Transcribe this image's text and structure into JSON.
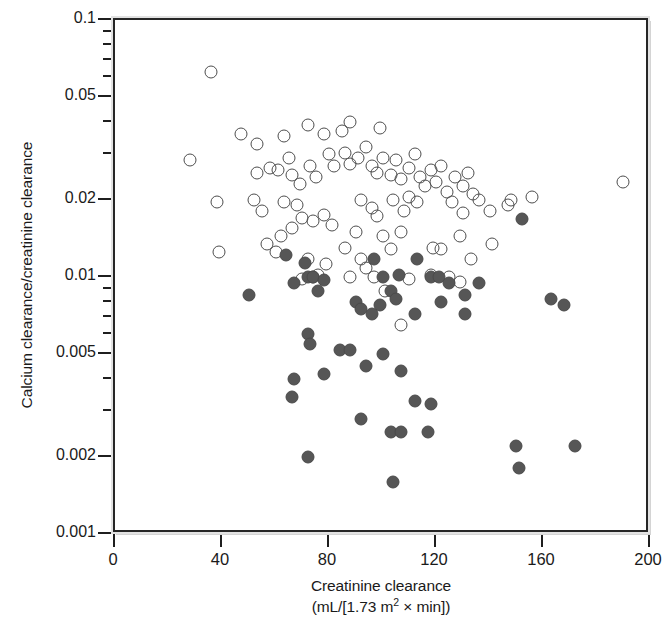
{
  "chart_data": {
    "type": "scatter",
    "title": "",
    "xlabel": "Creatinine clearance",
    "xlabel_units": "(mL/[1.73 m2 × min])",
    "xlabel_units_prefix": "(mL/[1.73 m",
    "xlabel_units_sup": "2",
    "xlabel_units_suffix": " × min])",
    "ylabel": "Calcium clearance/creatinine clearance",
    "xlim": [
      0,
      200
    ],
    "ylim": [
      0.001,
      0.1
    ],
    "yscale": "log",
    "xscale": "linear",
    "grid": false,
    "legend": null,
    "xticks": [
      0,
      40,
      80,
      120,
      160,
      200
    ],
    "xtick_labels": [
      "0",
      "40",
      "80",
      "120",
      "160",
      "200"
    ],
    "yticks": [
      0.1,
      0.05,
      0.02,
      0.01,
      0.005,
      0.002,
      0.001
    ],
    "ytick_labels": [
      "0.1",
      "0.05",
      "0.02",
      "0.01",
      "0.005",
      "0.002",
      "0.001"
    ],
    "yticks_minor": [
      0.09,
      0.08,
      0.07,
      0.06,
      0.04,
      0.03,
      0.009,
      0.008,
      0.007,
      0.006,
      0.004,
      0.003
    ],
    "colors": {
      "open_marker_edge": "#4d4d4d",
      "filled_marker": "#565656",
      "axis": "#1f1f1f",
      "frame": "#262626",
      "background": "#ffffff"
    },
    "series": [
      {
        "name": "open-circles",
        "marker": "open circle",
        "count": 96,
        "points": [
          [
            36,
            0.063
          ],
          [
            28,
            0.0285
          ],
          [
            47,
            0.036
          ],
          [
            53,
            0.033
          ],
          [
            63,
            0.0355
          ],
          [
            72,
            0.039
          ],
          [
            78,
            0.036
          ],
          [
            85,
            0.037
          ],
          [
            88,
            0.04
          ],
          [
            99,
            0.038
          ],
          [
            58,
            0.0265
          ],
          [
            61,
            0.026
          ],
          [
            65,
            0.029
          ],
          [
            66,
            0.025
          ],
          [
            53,
            0.0255
          ],
          [
            69,
            0.023
          ],
          [
            73,
            0.027
          ],
          [
            75,
            0.0245
          ],
          [
            80,
            0.03
          ],
          [
            82,
            0.027
          ],
          [
            86,
            0.0305
          ],
          [
            88,
            0.0275
          ],
          [
            91,
            0.029
          ],
          [
            94,
            0.032
          ],
          [
            96,
            0.027
          ],
          [
            98,
            0.0255
          ],
          [
            100,
            0.029
          ],
          [
            103,
            0.025
          ],
          [
            105,
            0.0285
          ],
          [
            107,
            0.024
          ],
          [
            110,
            0.0265
          ],
          [
            112,
            0.03
          ],
          [
            114,
            0.0245
          ],
          [
            116,
            0.0225
          ],
          [
            118,
            0.026
          ],
          [
            120,
            0.0235
          ],
          [
            122,
            0.027
          ],
          [
            124,
            0.0215
          ],
          [
            127,
            0.0245
          ],
          [
            130,
            0.0225
          ],
          [
            132,
            0.0255
          ],
          [
            134,
            0.021
          ],
          [
            110,
            0.0205
          ],
          [
            113,
            0.0195
          ],
          [
            38,
            0.0195
          ],
          [
            52,
            0.02
          ],
          [
            55,
            0.018
          ],
          [
            63,
            0.0195
          ],
          [
            68,
            0.019
          ],
          [
            70,
            0.017
          ],
          [
            74,
            0.0165
          ],
          [
            78,
            0.0175
          ],
          [
            81,
            0.016
          ],
          [
            66,
            0.0155
          ],
          [
            62,
            0.0145
          ],
          [
            92,
            0.02
          ],
          [
            96,
            0.0185
          ],
          [
            98,
            0.0172
          ],
          [
            104,
            0.02
          ],
          [
            108,
            0.018
          ],
          [
            126,
            0.0195
          ],
          [
            130,
            0.0178
          ],
          [
            136,
            0.02
          ],
          [
            140,
            0.018
          ],
          [
            147,
            0.019
          ],
          [
            148,
            0.02
          ],
          [
            156,
            0.0205
          ],
          [
            190,
            0.0235
          ],
          [
            39,
            0.0125
          ],
          [
            57,
            0.0135
          ],
          [
            60,
            0.0125
          ],
          [
            72,
            0.0118
          ],
          [
            79,
            0.0112
          ],
          [
            86,
            0.013
          ],
          [
            90,
            0.015
          ],
          [
            92,
            0.0118
          ],
          [
            94,
            0.0108
          ],
          [
            100,
            0.0145
          ],
          [
            103,
            0.0128
          ],
          [
            107,
            0.015
          ],
          [
            119,
            0.013
          ],
          [
            122,
            0.0128
          ],
          [
            129,
            0.0145
          ],
          [
            133,
            0.0118
          ],
          [
            141,
            0.0135
          ],
          [
            70,
            0.0098
          ],
          [
            74,
            0.01
          ],
          [
            88,
            0.01
          ],
          [
            97,
            0.01
          ],
          [
            110,
            0.0098
          ],
          [
            125,
            0.01
          ],
          [
            129,
            0.0096
          ],
          [
            101,
            0.0088
          ],
          [
            76,
            0.0102
          ],
          [
            118,
            0.0102
          ],
          [
            107,
            0.0065
          ]
        ]
      },
      {
        "name": "filled-circles",
        "marker": "filled circle",
        "count": 48,
        "points": [
          [
            50,
            0.0085
          ],
          [
            64,
            0.0122
          ],
          [
            67,
            0.0095
          ],
          [
            71,
            0.0113
          ],
          [
            72,
            0.01
          ],
          [
            74,
            0.01
          ],
          [
            76,
            0.0088
          ],
          [
            78,
            0.0097
          ],
          [
            97,
            0.0118
          ],
          [
            100,
            0.01
          ],
          [
            103,
            0.0088
          ],
          [
            106,
            0.0102
          ],
          [
            113,
            0.0118
          ],
          [
            118,
            0.01
          ],
          [
            121,
            0.01
          ],
          [
            125,
            0.0095
          ],
          [
            131,
            0.0085
          ],
          [
            152,
            0.0168
          ],
          [
            136,
            0.0095
          ],
          [
            163,
            0.0082
          ],
          [
            168,
            0.0078
          ],
          [
            72,
            0.006
          ],
          [
            73,
            0.0055
          ],
          [
            84,
            0.0052
          ],
          [
            90,
            0.008
          ],
          [
            92,
            0.0075
          ],
          [
            96,
            0.0072
          ],
          [
            99,
            0.0078
          ],
          [
            105,
            0.0082
          ],
          [
            112,
            0.0072
          ],
          [
            122,
            0.008
          ],
          [
            131,
            0.0072
          ],
          [
            67,
            0.004
          ],
          [
            78,
            0.0042
          ],
          [
            88,
            0.0052
          ],
          [
            100,
            0.005
          ],
          [
            94,
            0.0045
          ],
          [
            107,
            0.0043
          ],
          [
            112,
            0.0033
          ],
          [
            66,
            0.0034
          ],
          [
            92,
            0.0028
          ],
          [
            103,
            0.0025
          ],
          [
            107,
            0.0025
          ],
          [
            117,
            0.0025
          ],
          [
            118,
            0.0032
          ],
          [
            72,
            0.002
          ],
          [
            104,
            0.0016
          ],
          [
            150,
            0.0022
          ],
          [
            151,
            0.0018
          ],
          [
            172,
            0.0022
          ]
        ]
      }
    ]
  }
}
